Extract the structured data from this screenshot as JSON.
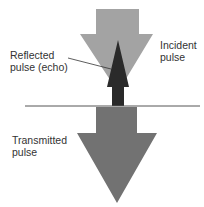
{
  "labels": {
    "incident": [
      "Incident",
      "pulse"
    ],
    "reflected": [
      "Reflected",
      "pulse (echo)"
    ],
    "transmitted": [
      "Transmitted",
      "pulse"
    ]
  },
  "colors": {
    "incident": "#a3a3a3",
    "reflected": "#2a2a2a",
    "transmitted": "#727272",
    "boundary": "#555555",
    "text": "#333333"
  }
}
